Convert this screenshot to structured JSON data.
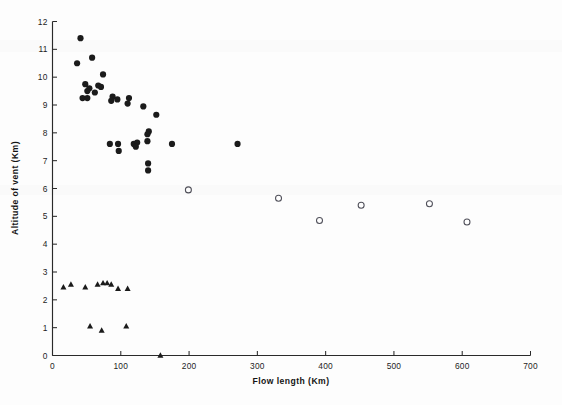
{
  "figure": {
    "background_color": "#fdfdfd",
    "ink_color": "#1b1b1b",
    "open_marker_stroke": "#50505a"
  },
  "axes": {
    "x_title": "Flow  length  (Km)",
    "y_title": "Altitude of vent  (Km)",
    "x_ticks": [
      "0",
      "100",
      "200",
      "300",
      "400",
      "500",
      "600",
      "700"
    ],
    "y_ticks": [
      "0",
      "1",
      "2",
      "3",
      "4",
      "5",
      "6",
      "7",
      "8",
      "9",
      "10",
      "11",
      "12"
    ]
  },
  "chart_data": {
    "type": "scatter",
    "title": "",
    "xlabel": "Flow length (Km)",
    "ylabel": "Altitude of vent (Km)",
    "xlim": [
      0,
      700
    ],
    "ylim": [
      0,
      12
    ],
    "xticks": [
      0,
      100,
      200,
      300,
      400,
      500,
      600,
      700
    ],
    "yticks": [
      0,
      1,
      2,
      3,
      4,
      5,
      6,
      7,
      8,
      9,
      10,
      11,
      12
    ],
    "grid": false,
    "legend": "none",
    "series": [
      {
        "name": "filled-circle",
        "marker": "filled circle",
        "color": "#1b1b1b",
        "points": [
          [
            41,
            11.4
          ],
          [
            36,
            10.5
          ],
          [
            58,
            10.7
          ],
          [
            74,
            10.1
          ],
          [
            48,
            9.75
          ],
          [
            67,
            9.7
          ],
          [
            71,
            9.65
          ],
          [
            54,
            9.6
          ],
          [
            51,
            9.5
          ],
          [
            62,
            9.45
          ],
          [
            44,
            9.25
          ],
          [
            51,
            9.25
          ],
          [
            88,
            9.3
          ],
          [
            95,
            9.2
          ],
          [
            86,
            9.15
          ],
          [
            112,
            9.25
          ],
          [
            110,
            9.05
          ],
          [
            133,
            8.95
          ],
          [
            152,
            8.65
          ],
          [
            141,
            8.05
          ],
          [
            139,
            7.95
          ],
          [
            139,
            7.7
          ],
          [
            84,
            7.6
          ],
          [
            96,
            7.6
          ],
          [
            119,
            7.6
          ],
          [
            124,
            7.65
          ],
          [
            122,
            7.5
          ],
          [
            175,
            7.6
          ],
          [
            271,
            7.6
          ],
          [
            97,
            7.35
          ],
          [
            140,
            6.9
          ],
          [
            140,
            6.65
          ]
        ]
      },
      {
        "name": "open-circle",
        "marker": "open circle",
        "color": "#ffffff",
        "points": [
          [
            199,
            5.95
          ],
          [
            331,
            5.65
          ],
          [
            391,
            4.85
          ],
          [
            452,
            5.4
          ],
          [
            552,
            5.45
          ],
          [
            607,
            4.8
          ]
        ]
      },
      {
        "name": "filled-triangle",
        "marker": "filled triangle",
        "color": "#1b1b1b",
        "points": [
          [
            16,
            2.45
          ],
          [
            27,
            2.55
          ],
          [
            48,
            2.45
          ],
          [
            66,
            2.55
          ],
          [
            74,
            2.6
          ],
          [
            80,
            2.6
          ],
          [
            86,
            2.55
          ],
          [
            96,
            2.4
          ],
          [
            110,
            2.4
          ],
          [
            55,
            1.05
          ],
          [
            72,
            0.9
          ],
          [
            108,
            1.05
          ],
          [
            158,
            0.0
          ]
        ]
      }
    ]
  }
}
